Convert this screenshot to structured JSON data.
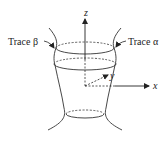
{
  "figure": {
    "labels": {
      "trace_beta": "Trace β",
      "trace_alpha": "Trace α",
      "axis_x": "x",
      "axis_y": "y",
      "axis_z": "z"
    },
    "colors": {
      "stroke": "#333333",
      "background": "#ffffff"
    }
  }
}
